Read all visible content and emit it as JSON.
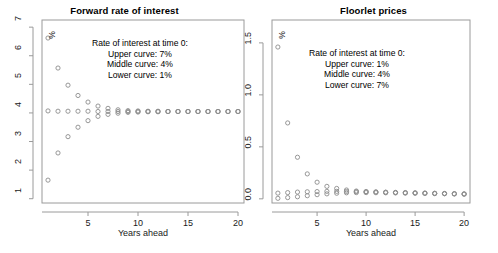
{
  "figure": {
    "width": 498,
    "height": 253,
    "background": "#ffffff",
    "point_color": "#8c8c8c",
    "axis_color": "#9a9a9a",
    "text_color": "#1a1a1a"
  },
  "panels": [
    {
      "id": "forward-rate",
      "title": "Forward rate of interest",
      "xlabel": "Years ahead",
      "unit_mark": "%",
      "annotation_lines": [
        "Rate of interest at time 0:",
        "Upper curve: 7%",
        "Middle curve: 4%",
        "Lower curve: 1%"
      ]
    },
    {
      "id": "floorlet-prices",
      "title": "Floorlet prices",
      "xlabel": "Years ahead",
      "unit_mark": "%",
      "annotation_lines": [
        "Rate of interest at time 0:",
        "Upper curve: 1%",
        "Middle curve: 4%",
        "Lower curve: 7%"
      ]
    }
  ],
  "chart_data": [
    {
      "type": "scatter",
      "id": "forward-rate",
      "title": "Forward rate of interest",
      "xlabel": "Years ahead",
      "ylabel": "%",
      "xlim": [
        0.4,
        20.6
      ],
      "ylim": [
        0.85,
        7.25
      ],
      "xticks": [
        5,
        10,
        15,
        20
      ],
      "xticklabels": [
        "5",
        "10",
        "15",
        "20"
      ],
      "yticks": [
        1,
        2,
        3,
        4,
        5,
        6,
        7
      ],
      "yticklabels": [
        "1",
        "2",
        "3",
        "4",
        "5",
        "6",
        "7"
      ],
      "grid": false,
      "legend": "none",
      "marker": "open-circle",
      "x": [
        1,
        2,
        3,
        4,
        5,
        6,
        7,
        8,
        9,
        10,
        11,
        12,
        13,
        14,
        15,
        16,
        17,
        18,
        19,
        20
      ],
      "series": [
        {
          "name": "Upper curve (r0 = 7%)",
          "values": [
            6.62,
            5.57,
            4.97,
            4.61,
            4.38,
            4.24,
            4.16,
            4.11,
            4.08,
            4.07,
            4.06,
            4.06,
            4.05,
            4.05,
            4.05,
            4.05,
            4.05,
            4.05,
            4.05,
            4.05
          ]
        },
        {
          "name": "Middle curve (r0 = 4%)",
          "values": [
            4.07,
            4.06,
            4.06,
            4.06,
            4.06,
            4.05,
            4.05,
            4.05,
            4.05,
            4.05,
            4.05,
            4.05,
            4.05,
            4.05,
            4.05,
            4.05,
            4.05,
            4.05,
            4.05,
            4.05
          ]
        },
        {
          "name": "Lower curve (r0 = 1%)",
          "values": [
            1.65,
            2.6,
            3.17,
            3.5,
            3.73,
            3.88,
            3.95,
            3.99,
            4.02,
            4.03,
            4.04,
            4.04,
            4.05,
            4.05,
            4.05,
            4.05,
            4.05,
            4.05,
            4.05,
            4.05
          ]
        }
      ],
      "annotations": [
        "Rate of interest at time 0:",
        "Upper curve: 7%",
        "Middle curve: 4%",
        "Lower curve: 1%"
      ]
    },
    {
      "type": "scatter",
      "id": "floorlet-prices",
      "title": "Floorlet prices",
      "xlabel": "Years ahead",
      "ylabel": "%",
      "xlim": [
        0.4,
        20.6
      ],
      "ylim": [
        -0.04,
        1.72
      ],
      "xticks": [
        5,
        10,
        15,
        20
      ],
      "xticklabels": [
        "5",
        "10",
        "15",
        "20"
      ],
      "yticks": [
        0.0,
        0.5,
        1.0,
        1.5
      ],
      "yticklabels": [
        "0.0",
        "0.5",
        "1.0",
        "1.5"
      ],
      "grid": false,
      "legend": "none",
      "marker": "open-circle",
      "x": [
        1,
        2,
        3,
        4,
        5,
        6,
        7,
        8,
        9,
        10,
        11,
        12,
        13,
        14,
        15,
        16,
        17,
        18,
        19,
        20
      ],
      "series": [
        {
          "name": "Upper curve (r0 = 1%)",
          "values": [
            1.46,
            0.73,
            0.4,
            0.24,
            0.16,
            0.12,
            0.1,
            0.085,
            0.075,
            0.07,
            0.066,
            0.063,
            0.06,
            0.058,
            0.056,
            0.054,
            0.052,
            0.05,
            0.048,
            0.046
          ]
        },
        {
          "name": "Middle curve (r0 = 4%)",
          "values": [
            0.055,
            0.06,
            0.065,
            0.068,
            0.07,
            0.072,
            0.072,
            0.071,
            0.07,
            0.068,
            0.066,
            0.064,
            0.062,
            0.06,
            0.058,
            0.056,
            0.054,
            0.052,
            0.05,
            0.048
          ]
        },
        {
          "name": "Lower curve (r0 = 7%)",
          "values": [
            0.005,
            0.012,
            0.02,
            0.03,
            0.04,
            0.048,
            0.054,
            0.058,
            0.06,
            0.06,
            0.059,
            0.058,
            0.057,
            0.055,
            0.054,
            0.052,
            0.05,
            0.049,
            0.047,
            0.045
          ]
        }
      ],
      "annotations": [
        "Rate of interest at time 0:",
        "Upper curve: 1%",
        "Middle curve: 4%",
        "Lower curve: 7%"
      ]
    }
  ]
}
